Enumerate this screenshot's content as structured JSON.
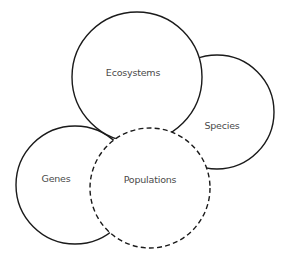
{
  "diagram": {
    "type": "overlapping-circles",
    "stroke_color": "#1a1a1a",
    "label_color": "#4a4a4a",
    "background": "#ffffff",
    "circles": [
      {
        "id": "species",
        "label": "Species",
        "cx": 217,
        "cy": 112,
        "r": 57,
        "style": "solid",
        "label_x": 222,
        "label_y": 125
      },
      {
        "id": "genes",
        "label": "Genes",
        "cx": 75,
        "cy": 185,
        "r": 59,
        "style": "solid",
        "label_x": 56,
        "label_y": 178
      },
      {
        "id": "ecosystems",
        "label": "Ecosystems",
        "cx": 137,
        "cy": 77,
        "r": 65,
        "style": "solid",
        "label_x": 133,
        "label_y": 72
      },
      {
        "id": "populations",
        "label": "Populations",
        "cx": 150,
        "cy": 188,
        "r": 60,
        "style": "dashed",
        "label_x": 150,
        "label_y": 179
      }
    ]
  }
}
